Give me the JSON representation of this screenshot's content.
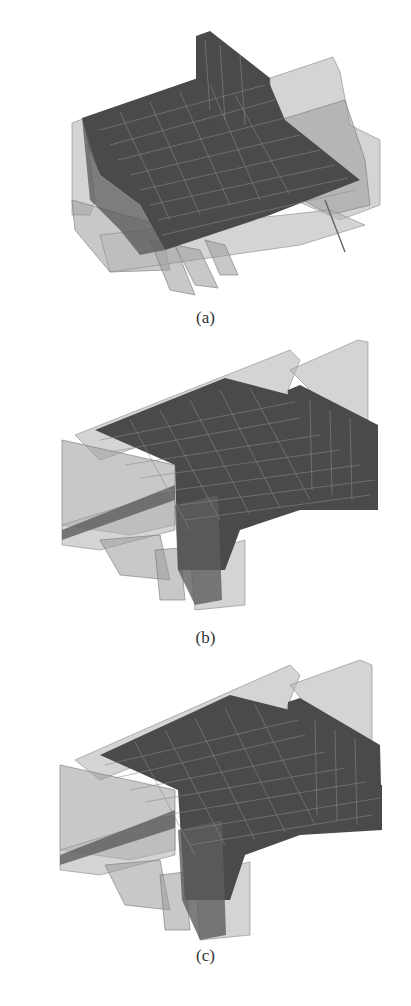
{
  "figure": {
    "panels": [
      {
        "id": "a",
        "label": "(a)",
        "description": "3D finite-element mesh model, view a"
      },
      {
        "id": "b",
        "label": "(b)",
        "description": "3D finite-element mesh model, view b"
      },
      {
        "id": "c",
        "label": "(c)",
        "description": "3D finite-element mesh model, view c"
      }
    ],
    "colors": {
      "mesh": "#4a4a4a",
      "gridlines": "#8a8a8a",
      "transparent_solids": "#9a9a9a",
      "background": "#ffffff"
    }
  }
}
